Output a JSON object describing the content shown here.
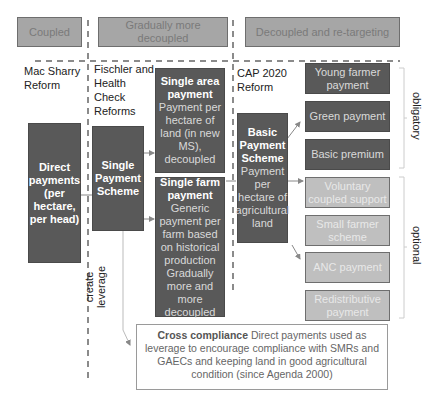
{
  "headers": {
    "coupled": "Coupled",
    "gradual": "Gradually more decoupled",
    "retarget": "Decoupled and re-targeting"
  },
  "reforms": {
    "mac_sharry": "Mac Sharry Reform",
    "fischler": "Fischler and Health Check Reforms",
    "cap2020": "CAP 2020 Reform"
  },
  "boxes": {
    "direct_payments": "Direct payments (per hectare, per head)",
    "sps": "Single Payment Scheme",
    "sap_title": "Single area payment",
    "sap_body": "Payment per hectare of land (in new MS), decoupled",
    "sfp_title": "Single farm payment",
    "sfp_body": "Generic payment per farm based on historical production Gradually more and more decoupled",
    "bps_title": "Basic Payment Scheme",
    "bps_body": "Payment per hectare of agricultural land"
  },
  "components": {
    "obligatory": [
      "Young farmer payment",
      "Green payment",
      "Basic premium"
    ],
    "optional": [
      "Voluntary coupled support",
      "Small farmer scheme",
      "ANC payment",
      "Redistributive payment"
    ]
  },
  "brackets": {
    "obligatory": "obligatory",
    "optional": "optional"
  },
  "leverage_label": "create leverage",
  "cross_compliance": {
    "title": "Cross compliance",
    "body": " Direct payments used as leverage to encourage compliance with SMRs and GAECs and keeping land in good agricultural condition (since Agenda 2000)"
  },
  "colors": {
    "header_fill": "#a6a6a6",
    "dark_fill": "#595959",
    "light_fill": "#bfbfbf"
  }
}
